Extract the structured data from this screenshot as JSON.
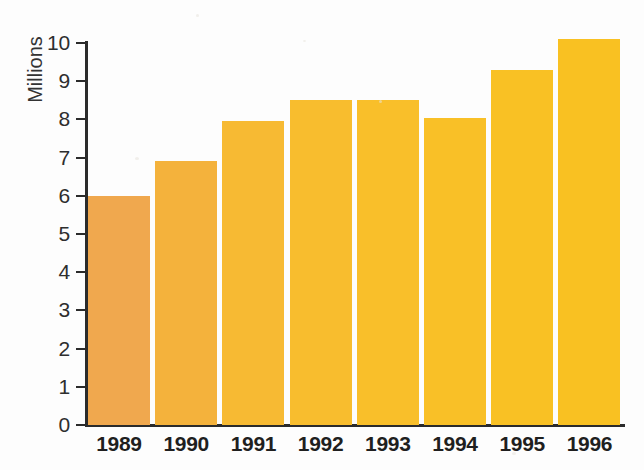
{
  "chart_data": {
    "type": "bar",
    "title": "",
    "subtitle": "",
    "xlabel": "",
    "ylabel": "Millions",
    "categories": [
      "1989",
      "1990",
      "1991",
      "1992",
      "1993",
      "1994",
      "1995",
      "1996"
    ],
    "values": [
      6.0,
      6.9,
      7.95,
      8.5,
      8.5,
      8.05,
      9.3,
      10.1
    ],
    "ylim": [
      0,
      10
    ],
    "ytick_labels": [
      "10",
      "9",
      "8",
      "7",
      "6",
      "5",
      "4",
      "3",
      "2",
      "1",
      "0"
    ],
    "ytick_values": [
      10,
      9,
      8,
      7,
      6,
      5,
      4,
      3,
      2,
      1,
      0
    ],
    "grid": false,
    "legend": null,
    "legend_position": "none",
    "bar_colors": [
      "#f0a84e",
      "#f4b23c",
      "#f7ba33",
      "#f8bd2e",
      "#f9bf2a",
      "#f9c027",
      "#f9c124",
      "#f9c122"
    ],
    "axis_color": "#2b2b2b",
    "background_color": "#fdfdfd",
    "text_color": "#2e2e2e"
  }
}
